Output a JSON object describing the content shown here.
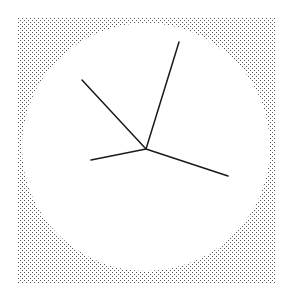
{
  "figure": {
    "width": 289,
    "height": 307,
    "background": "#ffffff",
    "stipple_region": {
      "x": 17,
      "y": 17,
      "width": 259,
      "height": 266,
      "dot_color": "#555555",
      "dot_spacing": 4
    },
    "dial": {
      "cx": 146,
      "cy": 147,
      "r": 124,
      "fill": "#ffffff"
    },
    "hands": {
      "center": {
        "x": 146,
        "y": 149
      },
      "color": "#1a1a1a",
      "stroke_width": 1.5,
      "lines": [
        {
          "name": "upper-hand",
          "x2": 179,
          "y2": 42
        },
        {
          "name": "upper-left-hand",
          "x2": 82,
          "y2": 80
        },
        {
          "name": "left-hand",
          "x2": 91,
          "y2": 160
        },
        {
          "name": "right-hand",
          "x2": 228,
          "y2": 176
        }
      ]
    }
  }
}
